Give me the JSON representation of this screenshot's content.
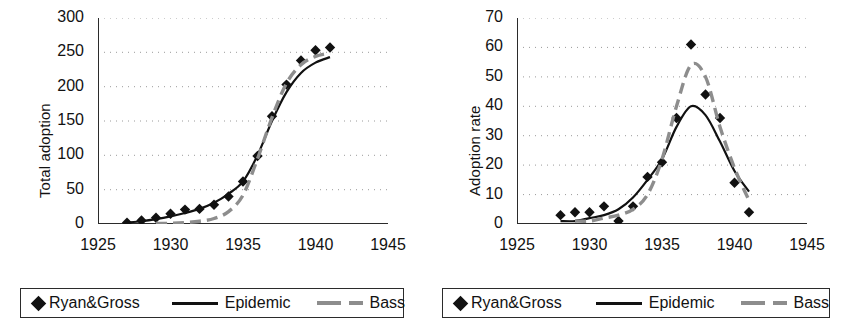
{
  "figure": {
    "background": "#ffffff",
    "series_colors": {
      "ryan_gross": "#111111",
      "epidemic": "#111111",
      "bass": "#8d8d8d"
    }
  },
  "legend": {
    "entries": [
      {
        "key": "ryan_gross",
        "label": "Ryan&Gross",
        "marker": "diamond-marker"
      },
      {
        "key": "epidemic",
        "label": "Epidemic",
        "marker": "solid-line-swatch"
      },
      {
        "key": "bass",
        "label": "Bass",
        "marker": "dashed-line-swatch"
      }
    ]
  },
  "chart_data": [
    {
      "id": "total-adoption",
      "type": "line",
      "title": "",
      "xlabel": "",
      "ylabel": "Total adoption",
      "xlim": [
        1925,
        1945
      ],
      "ylim": [
        0,
        300
      ],
      "xticks": [
        1925,
        1930,
        1935,
        1940,
        1945
      ],
      "yticks": [
        0,
        50,
        100,
        150,
        200,
        250,
        300
      ],
      "grid": "horizontal-dotted",
      "legend_position": "below",
      "series": [
        {
          "name": "Ryan&Gross",
          "style": "markers",
          "marker": "diamond",
          "color": "#111111",
          "x": [
            1927,
            1928,
            1929,
            1930,
            1931,
            1932,
            1933,
            1934,
            1935,
            1936,
            1937,
            1938,
            1939,
            1940,
            1941
          ],
          "values": [
            2,
            5,
            9,
            15,
            21,
            22,
            28,
            40,
            62,
            99,
            157,
            203,
            238,
            253,
            257
          ]
        },
        {
          "name": "Epidemic",
          "style": "solid-line",
          "color": "#111111",
          "x": [
            1927,
            1928,
            1929,
            1930,
            1931,
            1932,
            1933,
            1934,
            1935,
            1936,
            1937,
            1938,
            1939,
            1940,
            1941
          ],
          "values": [
            2,
            4,
            7,
            11,
            16,
            22,
            31,
            44,
            62,
            100,
            150,
            192,
            220,
            235,
            243
          ]
        },
        {
          "name": "Bass",
          "style": "dashed-line",
          "color": "#8d8d8d",
          "x": [
            1929,
            1930,
            1931,
            1932,
            1933,
            1934,
            1935,
            1936,
            1937,
            1938,
            1939,
            1940,
            1941
          ],
          "values": [
            1,
            1,
            2,
            4,
            8,
            18,
            42,
            95,
            155,
            205,
            232,
            244,
            249
          ]
        }
      ]
    },
    {
      "id": "adoption-rate",
      "type": "line",
      "title": "",
      "xlabel": "",
      "ylabel": "Adoption rate",
      "xlim": [
        1925,
        1945
      ],
      "ylim": [
        0,
        70
      ],
      "xticks": [
        1925,
        1930,
        1935,
        1940,
        1945
      ],
      "yticks": [
        0,
        10,
        20,
        30,
        40,
        50,
        60,
        70
      ],
      "grid": "horizontal-dotted",
      "legend_position": "below",
      "series": [
        {
          "name": "Ryan&Gross",
          "style": "markers",
          "marker": "diamond",
          "color": "#111111",
          "x": [
            1928,
            1929,
            1930,
            1931,
            1932,
            1933,
            1934,
            1935,
            1936,
            1937,
            1938,
            1939,
            1940,
            1941
          ],
          "values": [
            3,
            4,
            4,
            6,
            1,
            6,
            16,
            21,
            36,
            61,
            44,
            36,
            14,
            4
          ]
        },
        {
          "name": "Epidemic",
          "style": "solid-line",
          "color": "#111111",
          "x": [
            1928,
            1929,
            1930,
            1931,
            1932,
            1933,
            1934,
            1935,
            1936,
            1937,
            1938,
            1939,
            1940,
            1941
          ],
          "values": [
            1,
            1,
            2,
            3,
            5,
            9,
            15,
            22,
            33,
            40,
            37,
            28,
            18,
            11
          ]
        },
        {
          "name": "Bass",
          "style": "dashed-line",
          "color": "#8d8d8d",
          "x": [
            1929,
            1930,
            1931,
            1932,
            1933,
            1934,
            1935,
            1936,
            1937,
            1938,
            1939,
            1940,
            1941
          ],
          "values": [
            1,
            1,
            2,
            3,
            5,
            10,
            22,
            40,
            54,
            50,
            33,
            19,
            8
          ]
        }
      ]
    }
  ]
}
